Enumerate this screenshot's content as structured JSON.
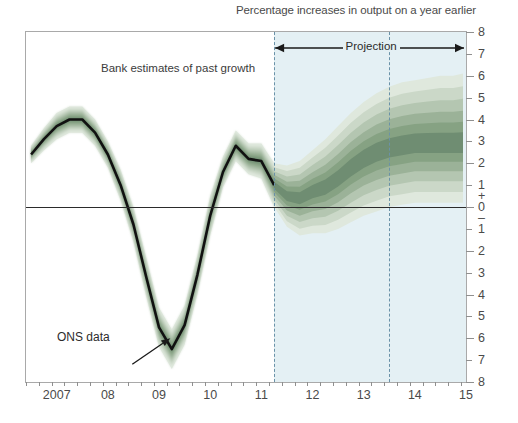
{
  "chart_title": "Percentage increases in output on a year earlier",
  "annotations": {
    "past_growth": "Bank estimates of past growth",
    "projection": "Projection",
    "ons_data": "ONS data"
  },
  "axes": {
    "y_labels_top_to_bottom": [
      "8",
      "7",
      "6",
      "5",
      "4",
      "3",
      "2",
      "1",
      "0",
      "1",
      "2",
      "3",
      "4",
      "5",
      "6",
      "7",
      "8"
    ],
    "y_plus_sign": "+",
    "y_minus_sign": "–",
    "x_labels": [
      "2007",
      "08",
      "09",
      "10",
      "11",
      "12",
      "13",
      "14",
      "15"
    ]
  },
  "colors": {
    "fan_darkest": "#6d8470",
    "fan_lightest": "#e8efe7",
    "projection_background": "#e4f0f4",
    "central_line": "#111111",
    "dashed_line": "#6a92a8",
    "frame": "#a9a9a9",
    "text": "#4a4a4a"
  },
  "chart_data": {
    "type": "area",
    "title": "Percentage increases in output on a year earlier",
    "subtitle": "Bank of England GDP fan chart",
    "xlabel": "",
    "ylabel": "Percentage increases in output on a year earlier",
    "xlim": [
      2006.4,
      2015.0
    ],
    "ylim": [
      -8,
      8
    ],
    "grid": false,
    "legend_position": "none",
    "projection_start": 2011.25,
    "projection_end": 2015.0,
    "vertical_dashed_lines": [
      2011.25,
      2013.5
    ],
    "zero_line": 0,
    "x": [
      2006.5,
      2006.75,
      2007.0,
      2007.25,
      2007.5,
      2007.75,
      2008.0,
      2008.25,
      2008.5,
      2008.75,
      2009.0,
      2009.25,
      2009.5,
      2009.75,
      2010.0,
      2010.25,
      2010.5,
      2010.75,
      2011.0,
      2011.25,
      2011.5,
      2011.75,
      2012.0,
      2012.25,
      2012.5,
      2012.75,
      2013.0,
      2013.25,
      2013.5,
      2013.75,
      2014.0,
      2014.25,
      2014.5,
      2014.75,
      2015.0
    ],
    "series": [
      {
        "name": "Central estimate (ONS data / mode)",
        "values": [
          2.4,
          3.1,
          3.7,
          4.0,
          4.0,
          3.4,
          2.4,
          1.0,
          -0.8,
          -3.2,
          -5.5,
          -6.5,
          -5.4,
          -3.1,
          -0.4,
          1.6,
          2.8,
          2.2,
          2.1,
          1.0,
          0.5,
          0.4,
          0.7,
          0.9,
          1.3,
          1.8,
          2.2,
          2.5,
          2.7,
          2.8,
          2.9,
          2.9,
          2.9,
          2.9,
          2.9
        ]
      },
      {
        "name": "90% band lower",
        "values": [
          2.0,
          2.6,
          3.1,
          3.4,
          3.4,
          2.8,
          1.8,
          0.3,
          -1.6,
          -4.1,
          -6.4,
          -7.4,
          -6.3,
          -4.0,
          -1.3,
          0.9,
          2.1,
          1.5,
          1.3,
          0.0,
          -0.9,
          -1.3,
          -1.2,
          -1.2,
          -1.0,
          -0.7,
          -0.4,
          -0.2,
          0.0,
          0.1,
          0.2,
          0.2,
          0.2,
          0.2,
          0.2
        ]
      },
      {
        "name": "90% band upper",
        "values": [
          2.8,
          3.6,
          4.3,
          4.6,
          4.6,
          4.0,
          3.0,
          1.7,
          -0.0,
          -2.3,
          -4.6,
          -5.6,
          -4.5,
          -2.2,
          0.5,
          2.3,
          3.5,
          2.9,
          2.9,
          2.0,
          1.9,
          2.1,
          2.6,
          3.1,
          3.7,
          4.3,
          4.8,
          5.2,
          5.5,
          5.7,
          5.8,
          5.9,
          6.0,
          6.0,
          6.1
        ]
      }
    ],
    "bands": [
      {
        "name": "band_1_innermost",
        "half_width_start": 0.12,
        "half_width_end": 0.45,
        "opacity_rank": 1
      },
      {
        "name": "band_2",
        "half_width_start": 0.24,
        "half_width_end": 0.95,
        "opacity_rank": 2
      },
      {
        "name": "band_3",
        "half_width_start": 0.36,
        "half_width_end": 1.5,
        "opacity_rank": 3
      },
      {
        "name": "band_4",
        "half_width_start": 0.48,
        "half_width_end": 2.1,
        "opacity_rank": 4
      },
      {
        "name": "band_5",
        "half_width_start": 0.62,
        "half_width_end": 2.75,
        "opacity_rank": 5
      },
      {
        "name": "band_6_outermost",
        "half_width_start": 0.78,
        "half_width_end": 3.4,
        "opacity_rank": 6
      }
    ]
  }
}
